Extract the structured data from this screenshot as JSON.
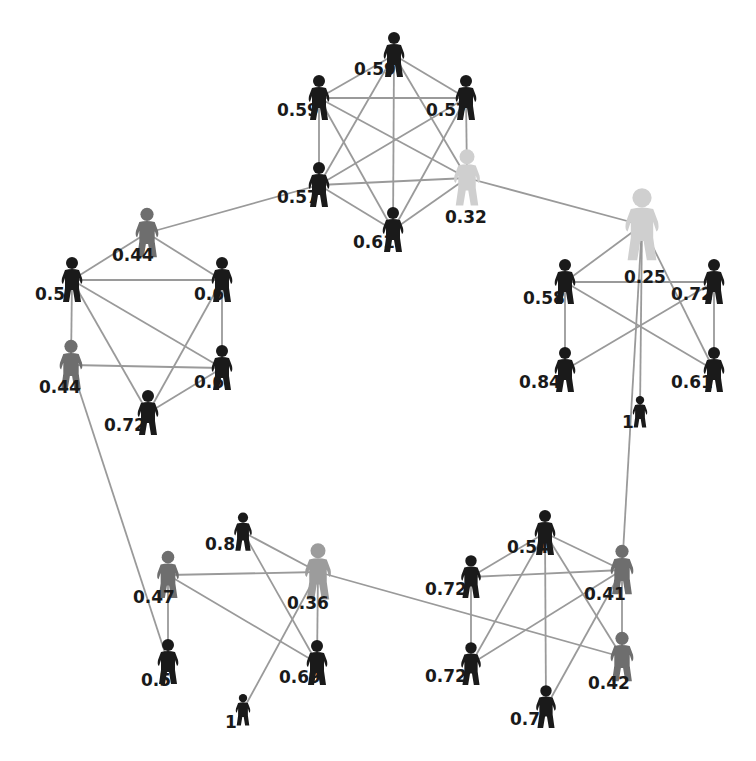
{
  "diagram": {
    "type": "social-network-graph",
    "node_icon": "person-icon",
    "colors": {
      "background": "#ffffff",
      "edge": "#9a9a9a",
      "label": "#1a1a1a",
      "node_dark": "#1a1a1a",
      "node_mid": "#6e6e6e",
      "node_grey": "#9c9c9c",
      "node_light": "#cfcfcf"
    },
    "nodes": [
      {
        "id": "a1",
        "label": "0.59",
        "x": 394,
        "y": 55,
        "size": 1.0,
        "tone": "node_dark",
        "lx": -40,
        "ly": 20
      },
      {
        "id": "a2",
        "label": "0.59",
        "x": 319,
        "y": 98,
        "size": 1.0,
        "tone": "node_dark",
        "lx": -42,
        "ly": 18
      },
      {
        "id": "a3",
        "label": "0.57",
        "x": 466,
        "y": 98,
        "size": 1.0,
        "tone": "node_dark",
        "lx": -40,
        "ly": 18
      },
      {
        "id": "a4",
        "label": "0.57",
        "x": 319,
        "y": 185,
        "size": 1.0,
        "tone": "node_dark",
        "lx": -42,
        "ly": 18
      },
      {
        "id": "a5",
        "label": "0.61",
        "x": 393,
        "y": 230,
        "size": 1.0,
        "tone": "node_dark",
        "lx": -40,
        "ly": 18
      },
      {
        "id": "a6",
        "label": "0.32",
        "x": 467,
        "y": 178,
        "size": 1.25,
        "tone": "node_light",
        "lx": -22,
        "ly": 45
      },
      {
        "id": "b1",
        "label": "0.44",
        "x": 147,
        "y": 233,
        "size": 1.1,
        "tone": "node_mid",
        "lx": -35,
        "ly": 28
      },
      {
        "id": "b2",
        "label": "0.5",
        "x": 72,
        "y": 280,
        "size": 1.0,
        "tone": "node_dark",
        "lx": -37,
        "ly": 20
      },
      {
        "id": "b3",
        "label": "0.6",
        "x": 222,
        "y": 280,
        "size": 1.0,
        "tone": "node_dark",
        "lx": -28,
        "ly": 20
      },
      {
        "id": "b4",
        "label": "0.44",
        "x": 71,
        "y": 365,
        "size": 1.1,
        "tone": "node_mid",
        "lx": -32,
        "ly": 28
      },
      {
        "id": "b5",
        "label": "0.6",
        "x": 222,
        "y": 368,
        "size": 1.0,
        "tone": "node_dark",
        "lx": -28,
        "ly": 20
      },
      {
        "id": "b6",
        "label": "0.72",
        "x": 148,
        "y": 413,
        "size": 1.0,
        "tone": "node_dark",
        "lx": -44,
        "ly": 18
      },
      {
        "id": "c1",
        "label": "0.25",
        "x": 642,
        "y": 225,
        "size": 1.6,
        "tone": "node_light",
        "lx": -18,
        "ly": 58
      },
      {
        "id": "c2",
        "label": "0.58",
        "x": 565,
        "y": 282,
        "size": 1.0,
        "tone": "node_dark",
        "lx": -42,
        "ly": 22
      },
      {
        "id": "c3",
        "label": "0.72",
        "x": 714,
        "y": 282,
        "size": 1.0,
        "tone": "node_dark",
        "lx": -43,
        "ly": 18
      },
      {
        "id": "c4",
        "label": "0.84",
        "x": 565,
        "y": 370,
        "size": 1.0,
        "tone": "node_dark",
        "lx": -46,
        "ly": 18
      },
      {
        "id": "c5",
        "label": "0.61",
        "x": 714,
        "y": 370,
        "size": 1.0,
        "tone": "node_dark",
        "lx": -43,
        "ly": 18
      },
      {
        "id": "c6",
        "label": "1",
        "x": 640,
        "y": 412,
        "size": 0.7,
        "tone": "node_dark",
        "lx": -18,
        "ly": 16
      },
      {
        "id": "d1",
        "label": "0.8",
        "x": 243,
        "y": 532,
        "size": 0.85,
        "tone": "node_dark",
        "lx": -38,
        "ly": 18
      },
      {
        "id": "d2",
        "label": "0.47",
        "x": 168,
        "y": 575,
        "size": 1.05,
        "tone": "node_mid",
        "lx": -35,
        "ly": 28
      },
      {
        "id": "d3",
        "label": "0.36",
        "x": 318,
        "y": 572,
        "size": 1.25,
        "tone": "node_grey",
        "lx": -31,
        "ly": 37
      },
      {
        "id": "d4",
        "label": "0.5",
        "x": 168,
        "y": 662,
        "size": 1.0,
        "tone": "node_dark",
        "lx": -27,
        "ly": 24
      },
      {
        "id": "d5",
        "label": "0.69",
        "x": 317,
        "y": 663,
        "size": 1.0,
        "tone": "node_dark",
        "lx": -38,
        "ly": 20
      },
      {
        "id": "d6",
        "label": "1",
        "x": 243,
        "y": 710,
        "size": 0.7,
        "tone": "node_dark",
        "lx": -18,
        "ly": 18
      },
      {
        "id": "e1",
        "label": "0.54",
        "x": 545,
        "y": 533,
        "size": 1.0,
        "tone": "node_dark",
        "lx": -38,
        "ly": 20
      },
      {
        "id": "e2",
        "label": "0.72",
        "x": 471,
        "y": 577,
        "size": 0.95,
        "tone": "node_dark",
        "lx": -46,
        "ly": 18
      },
      {
        "id": "e3",
        "label": "0.41",
        "x": 622,
        "y": 570,
        "size": 1.1,
        "tone": "node_mid",
        "lx": -38,
        "ly": 30
      },
      {
        "id": "e4",
        "label": "0.72",
        "x": 471,
        "y": 664,
        "size": 0.95,
        "tone": "node_dark",
        "lx": -46,
        "ly": 18
      },
      {
        "id": "e5",
        "label": "0.42",
        "x": 622,
        "y": 657,
        "size": 1.1,
        "tone": "node_mid",
        "lx": -34,
        "ly": 32
      },
      {
        "id": "e6",
        "label": "0.7",
        "x": 546,
        "y": 707,
        "size": 0.95,
        "tone": "node_dark",
        "lx": -36,
        "ly": 18
      }
    ],
    "edges": [
      [
        "a1",
        "a2"
      ],
      [
        "a1",
        "a3"
      ],
      [
        "a1",
        "a4"
      ],
      [
        "a1",
        "a5"
      ],
      [
        "a1",
        "a6"
      ],
      [
        "a2",
        "a3"
      ],
      [
        "a2",
        "a4"
      ],
      [
        "a2",
        "a5"
      ],
      [
        "a2",
        "a6"
      ],
      [
        "a3",
        "a4"
      ],
      [
        "a3",
        "a5"
      ],
      [
        "a3",
        "a6"
      ],
      [
        "a4",
        "a5"
      ],
      [
        "a4",
        "a6"
      ],
      [
        "a5",
        "a6"
      ],
      [
        "b1",
        "b2"
      ],
      [
        "b1",
        "b3"
      ],
      [
        "b2",
        "b3"
      ],
      [
        "b2",
        "b4"
      ],
      [
        "b2",
        "b5"
      ],
      [
        "b2",
        "b6"
      ],
      [
        "b3",
        "b5"
      ],
      [
        "b3",
        "b6"
      ],
      [
        "b4",
        "b5"
      ],
      [
        "b5",
        "b6"
      ],
      [
        "c1",
        "c2"
      ],
      [
        "c1",
        "c5"
      ],
      [
        "c1",
        "c6"
      ],
      [
        "c2",
        "c3"
      ],
      [
        "c2",
        "c4"
      ],
      [
        "c2",
        "c5"
      ],
      [
        "c3",
        "c4"
      ],
      [
        "c3",
        "c5"
      ],
      [
        "d1",
        "d3"
      ],
      [
        "d1",
        "d5"
      ],
      [
        "d2",
        "d3"
      ],
      [
        "d2",
        "d4"
      ],
      [
        "d2",
        "d5"
      ],
      [
        "d3",
        "d5"
      ],
      [
        "d3",
        "d6"
      ],
      [
        "e1",
        "e2"
      ],
      [
        "e1",
        "e3"
      ],
      [
        "e1",
        "e4"
      ],
      [
        "e1",
        "e5"
      ],
      [
        "e1",
        "e6"
      ],
      [
        "e2",
        "e3"
      ],
      [
        "e2",
        "e4"
      ],
      [
        "e3",
        "e4"
      ],
      [
        "e3",
        "e5"
      ],
      [
        "e3",
        "e6"
      ],
      [
        "a4",
        "b1"
      ],
      [
        "a6",
        "c1"
      ],
      [
        "b4",
        "d4"
      ],
      [
        "c1",
        "e3"
      ],
      [
        "d3",
        "e5"
      ]
    ]
  }
}
